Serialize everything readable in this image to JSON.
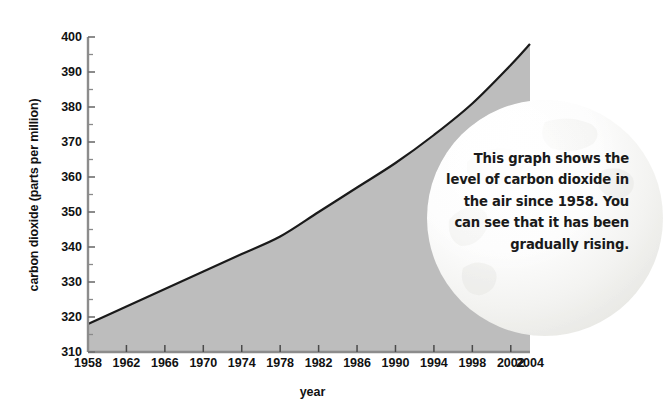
{
  "chart_data": {
    "type": "area",
    "title": "",
    "xlabel": "year",
    "ylabel": "carbon dioxide (parts per million)",
    "xlim": [
      1958,
      2004
    ],
    "ylim": [
      310,
      400
    ],
    "grid": false,
    "legend": "none",
    "x_ticks": [
      1958,
      1962,
      1966,
      1970,
      1974,
      1978,
      1982,
      1986,
      1990,
      1994,
      1998,
      2002,
      2004
    ],
    "y_ticks": [
      310,
      320,
      330,
      340,
      350,
      360,
      370,
      380,
      390,
      400
    ],
    "y_minor_tick_step": 5,
    "series": [
      {
        "name": "carbon dioxide",
        "x": [
          1958,
          1962,
          1966,
          1970,
          1974,
          1978,
          1982,
          1986,
          1990,
          1994,
          1998,
          2002,
          2004
        ],
        "values": [
          318,
          323,
          328,
          333,
          338,
          343,
          350,
          357,
          364,
          372,
          381,
          392,
          398
        ]
      }
    ],
    "fill_color": "#bdbdbd",
    "line_color": "#1a1a1a"
  },
  "annotation": {
    "name": "callout-bubble",
    "lines": [
      "This graph shows the",
      "level of carbon dioxide in",
      "the air since 1958. You",
      "can see that it has been",
      "gradually rising."
    ],
    "text": "This graph shows the level of carbon dioxide in the air since 1958. You can see that it has been gradually rising."
  }
}
